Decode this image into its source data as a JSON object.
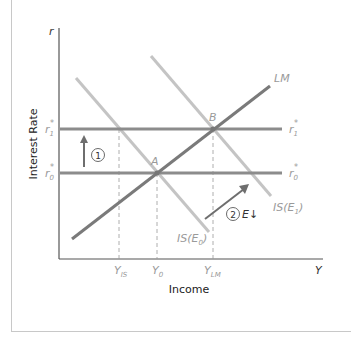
{
  "diagram": {
    "type": "IS-LM diagram",
    "axes": {
      "y_axis_symbol": "r",
      "x_axis_symbol": "Y",
      "y_axis_title": "Interest Rate",
      "x_axis_title": "Income"
    },
    "curves": {
      "lm": "LM",
      "is_e0": "IS(E",
      "is_e0_sub": "0",
      "is_e1": "IS(E",
      "is_e1_sub": "1",
      "close_paren": ")"
    },
    "rates": {
      "r1_left": "r",
      "r1_sub": "1",
      "r0_left": "r",
      "r0_sub": "0",
      "star": "*"
    },
    "points": {
      "a": "A",
      "b": "B"
    },
    "x_ticks": {
      "y_is": "Y",
      "y_is_sub": "IS",
      "y_0": "Y",
      "y_0_sub": "0",
      "y_lm": "Y",
      "y_lm_sub": "LM"
    },
    "annotations": {
      "step1": "1",
      "step2": "2",
      "step2_label": "E↓"
    },
    "colors": {
      "lm_line": "#7a7a7a",
      "rate_line": "#8c8c8c",
      "is_line": "#c4c4c4",
      "label": "#9a9a9a",
      "arrow": "#6e6e6e"
    }
  }
}
